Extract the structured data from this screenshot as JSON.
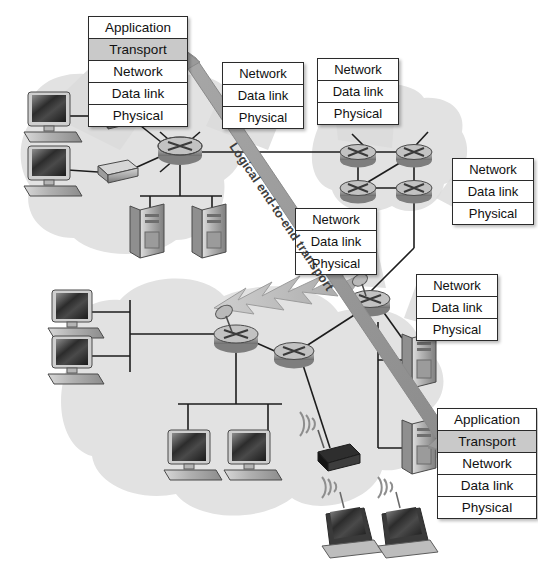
{
  "diagram": {
    "annotation": "Logical end-to-end transport",
    "colors": {
      "highlight_row": "#c9c9c9",
      "box_border": "#2b2b2b",
      "box_fill": "#ffffff",
      "cloud_fill": "#e2e2e2",
      "arrow": "#9a9a9a",
      "link": "#1d1d1d",
      "page_background": "#ffffff"
    },
    "layer_names": {
      "application": "Application",
      "transport": "Transport",
      "network": "Network",
      "data_link": "Data link",
      "physical": "Physical"
    },
    "stacks": [
      {
        "id": "host-stack-top-left",
        "kind": "five-layer",
        "highlighted": "Transport",
        "rows": [
          "Application",
          "Transport",
          "Network",
          "Data link",
          "Physical"
        ]
      },
      {
        "id": "router-stack-upper-middle-left",
        "kind": "three-layer",
        "highlighted": null,
        "rows": [
          "Network",
          "Data link",
          "Physical"
        ]
      },
      {
        "id": "router-stack-upper-middle-right",
        "kind": "three-layer",
        "highlighted": null,
        "rows": [
          "Network",
          "Data link",
          "Physical"
        ]
      },
      {
        "id": "router-stack-right",
        "kind": "three-layer",
        "highlighted": null,
        "rows": [
          "Network",
          "Data link",
          "Physical"
        ]
      },
      {
        "id": "router-stack-center",
        "kind": "three-layer",
        "highlighted": null,
        "rows": [
          "Network",
          "Data link",
          "Physical"
        ]
      },
      {
        "id": "router-stack-lower-right",
        "kind": "three-layer",
        "highlighted": null,
        "rows": [
          "Network",
          "Data link",
          "Physical"
        ]
      },
      {
        "id": "host-stack-bottom-right",
        "kind": "five-layer",
        "highlighted": "Transport",
        "rows": [
          "Application",
          "Transport",
          "Network",
          "Data link",
          "Physical"
        ]
      }
    ],
    "nodes": {
      "clouds": [
        "lan-cloud-top-left",
        "wan-cloud-upper-right",
        "lan-cloud-bottom"
      ],
      "workstations": 6,
      "servers": 4,
      "switches": 2,
      "routers": 8,
      "access_points": 1,
      "laptops": 2,
      "wireless_link": "lightning-bolt-microwave-link"
    }
  }
}
